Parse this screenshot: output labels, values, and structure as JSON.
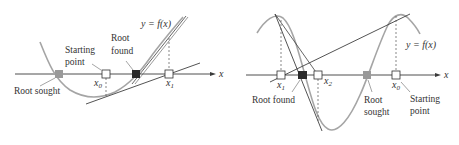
{
  "colors": {
    "axis": "#3a3a3a",
    "curve": "#9a9a9a",
    "tangent": "#4a4a4a",
    "root_sought": "#9a9a9a",
    "root_found": "#2a2a2a",
    "background": "#ffffff"
  },
  "left_panel": {
    "axis_label": "x",
    "function_label": "y = f(x)",
    "labels": {
      "starting_point_line1": "Starting",
      "starting_point_line2": "point",
      "root_found_line1": "Root",
      "root_found_line2": "found",
      "root_sought": "Root sought"
    },
    "points": {
      "x0": {
        "base": "x",
        "sub": "0"
      },
      "x1": {
        "base": "x",
        "sub": "1"
      }
    }
  },
  "right_panel": {
    "axis_label": "x",
    "function_label": "y = f(x)",
    "labels": {
      "root_found": "Root found",
      "root_sought_line1": "Root",
      "root_sought_line2": "sought",
      "starting_point_line1": "Starting",
      "starting_point_line2": "point"
    },
    "points": {
      "x0": {
        "base": "x",
        "sub": "0"
      },
      "x1": {
        "base": "x",
        "sub": "1"
      },
      "x2": {
        "base": "x",
        "sub": "2"
      }
    }
  }
}
